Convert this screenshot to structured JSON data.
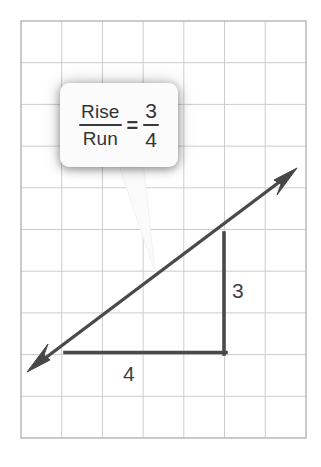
{
  "figure": {
    "name": "slope-rise-over-run",
    "background_color": "#ffffff",
    "grid": {
      "line_color": "#c9c9c9",
      "border_color": "#b0b0b0",
      "columns": 7,
      "rows": 10,
      "cell_width": 40.7,
      "cell_height": 41.7,
      "left": 21,
      "top": 21,
      "right": 306,
      "bottom": 438
    },
    "slope_line": {
      "color": "#4a4a4a",
      "stroke_width": 3.4,
      "start_x": 28,
      "start_y": 371,
      "end_x": 296,
      "end_y": 170,
      "arrow_start": "swallowtail",
      "arrow_end": "swallowtail"
    },
    "triangle": {
      "color": "#4a4a4a",
      "stroke_width": 3.4,
      "corner_x": 224,
      "corner_y": 352,
      "run_start_x": 66,
      "rise_top_y": 233
    }
  },
  "callout": {
    "name": "rise-over-run-callout",
    "background_color": "#fbfbfb",
    "text_color": "#333333",
    "formula": {
      "left_fraction": {
        "numerator": "Rise",
        "denominator": "Run"
      },
      "equals": "=",
      "right_fraction": {
        "numerator": "3",
        "denominator": "4"
      }
    },
    "tail": {
      "tip_x": 155,
      "tip_y": 272,
      "base_left_x": 117,
      "base_right_x": 143,
      "base_y": 166
    }
  },
  "labels": {
    "rise": "3",
    "run": "4"
  }
}
